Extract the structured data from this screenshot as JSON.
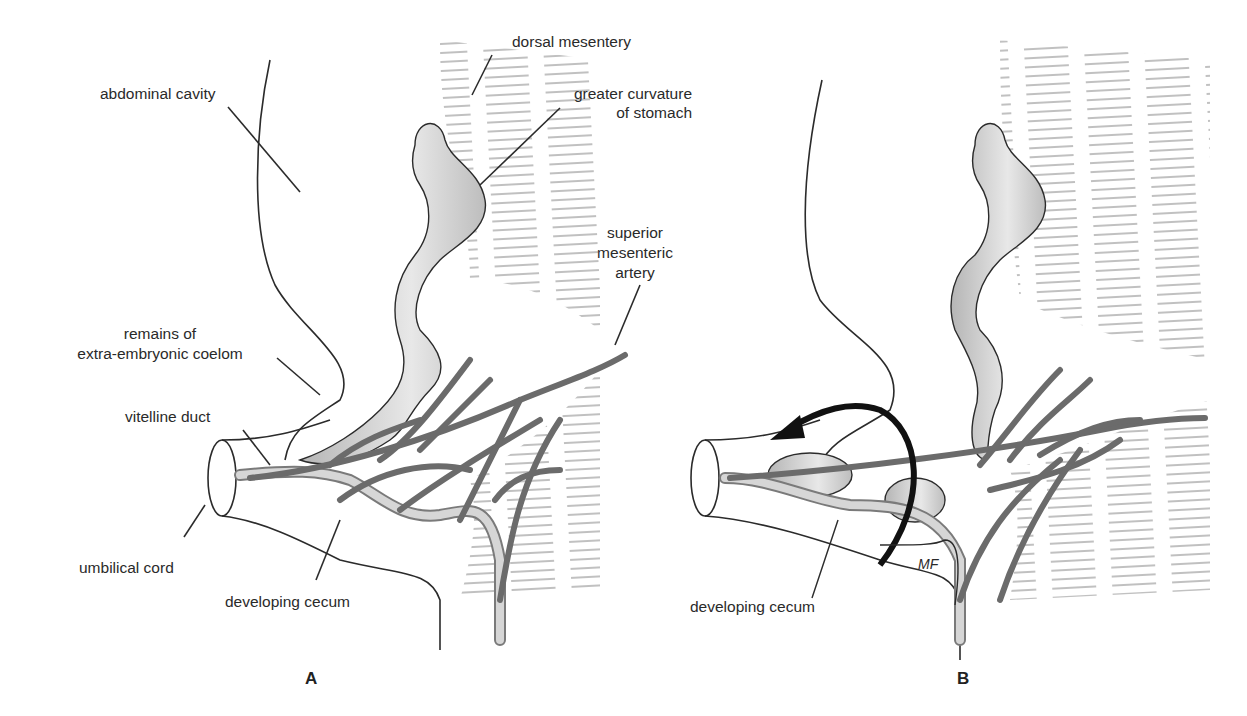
{
  "figure": {
    "panels": [
      {
        "id": "A",
        "label": "A",
        "labels": {
          "abdominal_cavity": "abdominal cavity",
          "dorsal_mesentery": "dorsal mesentery",
          "greater_curvature_1": "greater curvature",
          "greater_curvature_2": "of stomach",
          "sma_1": "superior",
          "sma_2": "mesenteric",
          "sma_3": "artery",
          "remains_1": "remains of",
          "remains_2": "extra-embryonic coelom",
          "vitelline_duct": "vitelline duct",
          "umbilical_cord": "umbilical cord",
          "developing_cecum": "developing cecum"
        }
      },
      {
        "id": "B",
        "label": "B",
        "labels": {
          "developing_cecum": "developing cecum",
          "signature": "MF"
        }
      }
    ],
    "colors": {
      "line": "#2b2b2b",
      "vessel": "#6b6b6b",
      "gut_fill": "#c9c9c9",
      "hatch": "#555555",
      "arrow": "#111111"
    }
  }
}
